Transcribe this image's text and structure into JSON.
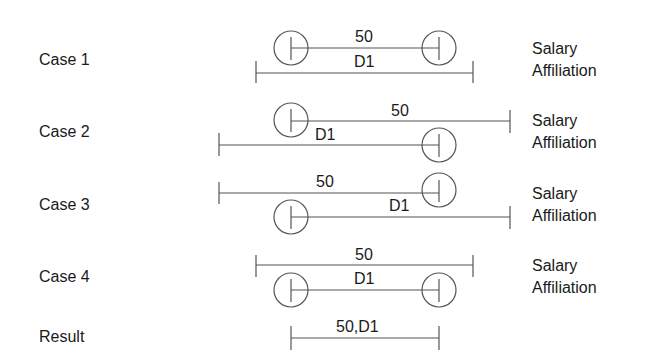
{
  "cases": [
    {
      "label": "Case 1",
      "top_text": "50",
      "bottom_text": "D1",
      "side": [
        "Salary",
        "Affiliation"
      ]
    },
    {
      "label": "Case 2",
      "top_text": "50",
      "bottom_text": "D1",
      "side": [
        "Salary",
        "Affiliation"
      ]
    },
    {
      "label": "Case 3",
      "top_text": "50",
      "bottom_text": "D1",
      "side": [
        "Salary",
        "Affiliation"
      ]
    },
    {
      "label": "Case 4",
      "top_text": "50",
      "bottom_text": "D1",
      "side": [
        "Salary",
        "Affiliation"
      ]
    }
  ],
  "result": {
    "label": "Result",
    "text": "50,D1"
  },
  "colors": {
    "line": "#555555",
    "text": "#1a1a1a",
    "background": "#ffffff"
  }
}
